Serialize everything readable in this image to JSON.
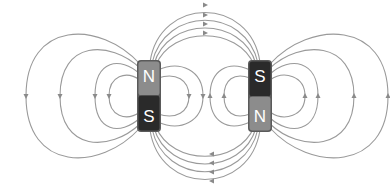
{
  "diagram": {
    "title": "Magnetic field lines between two bar magnets (opposite orientation)",
    "colors": {
      "background": "#ffffff",
      "field_line": "#9a9a9a",
      "arrow": "#8a8a8a",
      "north_pole": "#8c8c8c",
      "south_pole": "#2a2a2a",
      "label": "#ffffff"
    },
    "magnets": [
      {
        "id": "left-magnet",
        "top_pole": "N",
        "bottom_pole": "S"
      },
      {
        "id": "right-magnet",
        "top_pole": "S",
        "bottom_pole": "N"
      }
    ],
    "field_line_groups": [
      {
        "region": "top-arcs",
        "count": 4,
        "arrow_direction": "right"
      },
      {
        "region": "bottom-arcs",
        "count": 4,
        "arrow_direction": "left"
      },
      {
        "region": "left-outer-loops",
        "count": 4,
        "arrow_direction": "down"
      },
      {
        "region": "right-outer-loops",
        "count": 4,
        "arrow_direction": "up"
      },
      {
        "region": "inner-left-loops",
        "count": 2,
        "arrow_direction": "down"
      },
      {
        "region": "inner-right-loops",
        "count": 2,
        "arrow_direction": "up"
      }
    ]
  }
}
